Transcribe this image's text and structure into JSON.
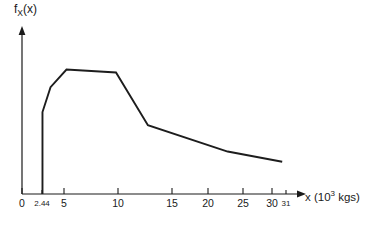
{
  "chart_data": {
    "type": "line",
    "title": "",
    "xlabel": "x (10^3 kgs)",
    "ylabel": "f_X(x)",
    "grid": false,
    "legend": "none",
    "xlim": [
      0,
      33
    ],
    "ylim": [
      0,
      1.1
    ],
    "x_tick_values": [
      0,
      2.44,
      5,
      10,
      15,
      20,
      25,
      30,
      31
    ],
    "x_tick_labels": [
      "0",
      "2.44",
      "5",
      "10",
      "15",
      "20",
      "25",
      "30",
      "31"
    ],
    "y_tick_values": [],
    "y_tick_labels": [],
    "series": [
      {
        "name": "f_X(x)",
        "x": [
          2.44,
          2.44,
          3.4,
          5.3,
          11.2,
          15.0,
          24.5,
          31.0
        ],
        "values": [
          0.0,
          0.56,
          0.73,
          0.85,
          0.83,
          0.47,
          0.29,
          0.22
        ]
      }
    ],
    "annotations": []
  },
  "axis_labels": {
    "y_label_base": "f",
    "y_label_sub": "X",
    "y_label_arg": "(x)",
    "x_label_var": "x (10",
    "x_label_sup": "3",
    "x_label_unit": " kgs)"
  },
  "ticks": [
    {
      "label": "0",
      "x_px": 22,
      "small": false
    },
    {
      "label": "2.44",
      "x_px": 42,
      "small": true
    },
    {
      "label": "5",
      "x_px": 64,
      "small": false
    },
    {
      "label": "10",
      "x_px": 118,
      "small": false
    },
    {
      "label": "15",
      "x_px": 172,
      "small": false
    },
    {
      "label": "20",
      "x_px": 208,
      "small": false
    },
    {
      "label": "25",
      "x_px": 243,
      "small": false
    },
    {
      "label": "30",
      "x_px": 272,
      "small": false
    },
    {
      "label": "31",
      "x_px": 286,
      "small": true
    }
  ],
  "colors": {
    "curve": "#1d1d1d",
    "axis": "#1a1a1a",
    "background": "#ffffff"
  }
}
